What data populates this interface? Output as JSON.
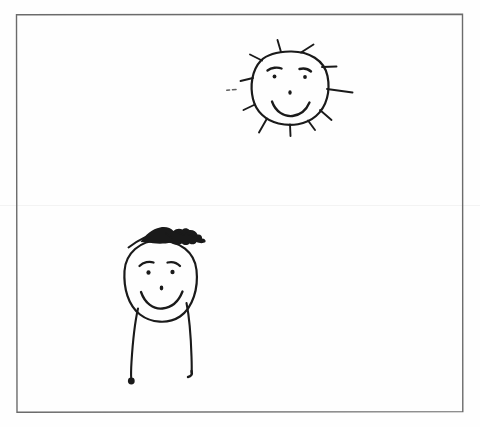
{
  "page": {
    "kind": "scanned-hand-drawing",
    "background_color": "#ffffff",
    "ink_color": "#1a1a1a",
    "frame_color": "#6b6b6b",
    "width": 480,
    "height": 427
  },
  "frame": {
    "label": "drawing border rectangle",
    "x": 16,
    "y": 14,
    "width": 447,
    "height": 398
  },
  "artifacts": {
    "seam_label": "faint horizontal scan fold line",
    "seam_y": 205
  },
  "sun": {
    "label": "smiling sun",
    "center_x": 290,
    "center_y": 88,
    "radius": 37,
    "ray_count": 11,
    "features": {
      "left_eyebrow": "left eyebrow",
      "right_eyebrow": "right eyebrow",
      "left_eye": "left eye",
      "right_eye": "right eye",
      "nose": "nose",
      "mouth": "smiling mouth"
    }
  },
  "person": {
    "label": "stick figure person with spiky hair",
    "head_center_x": 160,
    "head_center_y": 282,
    "head_rx": 37,
    "head_ry": 42,
    "features": {
      "hair": "spiky scribbled hair",
      "left_eyebrow": "left eyebrow",
      "right_eyebrow": "right eyebrow",
      "left_eye": "left eye",
      "right_eye": "right eye",
      "nose": "nose",
      "mouth": "smiling mouth",
      "left_leg": "left leg",
      "right_leg": "right leg",
      "left_foot": "left foot dot",
      "right_foot": "right foot hook"
    }
  },
  "alt_text": "A hand-drawn picture inside a thin rectangular border: a smiling sun with eleven rays in the upper right and a smiling person with spiky hair and two long legs in the lower left."
}
